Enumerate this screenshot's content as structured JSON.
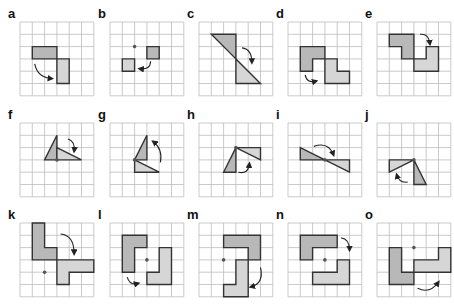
{
  "colors": {
    "grid": "#bdbdbd",
    "original_fill": "#b8b8b8",
    "image_fill": "#d6d6d6",
    "outline": "#333333",
    "arrow": "#222222",
    "center_dot": "#555555"
  },
  "grid": {
    "cols": 6,
    "rows": 6,
    "cell": 12.3
  },
  "panels": [
    {
      "label": "a",
      "x": 20,
      "y": 22,
      "original": [
        [
          1,
          2
        ],
        [
          3,
          2
        ],
        [
          3,
          3
        ],
        [
          1,
          3
        ]
      ],
      "image": [
        [
          3,
          3
        ],
        [
          4,
          3
        ],
        [
          4,
          5
        ],
        [
          3,
          5
        ]
      ],
      "dot": null,
      "arrow": {
        "from": [
          1.2,
          3.4
        ],
        "ctrl": [
          1.4,
          4.5
        ],
        "to": [
          2.6,
          4.6
        ]
      }
    },
    {
      "label": "b",
      "x": 110,
      "y": 22,
      "original": [
        [
          3,
          2
        ],
        [
          4,
          2
        ],
        [
          4,
          3
        ],
        [
          3,
          3
        ]
      ],
      "image": [
        [
          1,
          3
        ],
        [
          2,
          3
        ],
        [
          2,
          4
        ],
        [
          1,
          4
        ]
      ],
      "dot": [
        2,
        2
      ],
      "arrow": {
        "from": [
          3.3,
          3.2
        ],
        "ctrl": [
          3.3,
          3.9
        ],
        "to": [
          2.4,
          3.8
        ]
      }
    },
    {
      "label": "c",
      "x": 199,
      "y": 22,
      "original": [
        [
          1,
          1
        ],
        [
          3,
          1
        ],
        [
          3,
          3
        ]
      ],
      "image": [
        [
          3,
          3
        ],
        [
          3,
          5
        ],
        [
          5,
          5
        ]
      ],
      "dot": null,
      "arrow": {
        "from": [
          3.5,
          2.1
        ],
        "ctrl": [
          4.3,
          2.2
        ],
        "to": [
          4.3,
          3.3
        ]
      }
    },
    {
      "label": "d",
      "x": 288,
      "y": 22,
      "original": [
        [
          1,
          2
        ],
        [
          3,
          2
        ],
        [
          3,
          3
        ],
        [
          2,
          3
        ],
        [
          2,
          4
        ],
        [
          1,
          4
        ]
      ],
      "image": [
        [
          3,
          3
        ],
        [
          4,
          3
        ],
        [
          4,
          4
        ],
        [
          5,
          4
        ],
        [
          5,
          5
        ],
        [
          3,
          5
        ]
      ],
      "dot": null,
      "arrow": {
        "from": [
          1.4,
          4.3
        ],
        "ctrl": [
          1.5,
          5
        ],
        "to": [
          2.3,
          4.8
        ]
      }
    },
    {
      "label": "e",
      "x": 377,
      "y": 22,
      "original": [
        [
          1,
          1
        ],
        [
          3,
          1
        ],
        [
          3,
          3
        ],
        [
          2,
          3
        ],
        [
          2,
          2
        ],
        [
          1,
          2
        ]
      ],
      "image": [
        [
          4,
          2
        ],
        [
          5,
          2
        ],
        [
          5,
          4
        ],
        [
          3,
          4
        ],
        [
          3,
          3
        ],
        [
          4,
          3
        ]
      ],
      "dot": null,
      "arrow": {
        "from": [
          3.5,
          1
        ],
        "ctrl": [
          4.2,
          0.9
        ],
        "to": [
          4.3,
          1.8
        ]
      }
    },
    {
      "label": "f",
      "x": 20,
      "y": 123,
      "original": [
        [
          3,
          1
        ],
        [
          2,
          3
        ],
        [
          3,
          3
        ]
      ],
      "image": [
        [
          3,
          2
        ],
        [
          3,
          3
        ],
        [
          5,
          3
        ]
      ],
      "dot": [
        3,
        3
      ],
      "arrow": {
        "from": [
          3.9,
          1.3
        ],
        "ctrl": [
          4.5,
          1.5
        ],
        "to": [
          4.4,
          2.3
        ]
      }
    },
    {
      "label": "g",
      "x": 110,
      "y": 123,
      "original": [
        [
          3,
          1
        ],
        [
          2,
          3
        ],
        [
          3,
          3
        ]
      ],
      "image": [
        [
          2,
          3
        ],
        [
          2,
          4
        ],
        [
          4,
          4
        ]
      ],
      "dot": [
        2,
        3
      ],
      "arrow": {
        "from": [
          4.1,
          3.2
        ],
        "ctrl": [
          4.3,
          2.1
        ],
        "to": [
          3.5,
          1.5
        ]
      }
    },
    {
      "label": "h",
      "x": 199,
      "y": 123,
      "original": [
        [
          3,
          2
        ],
        [
          2,
          4
        ],
        [
          3,
          4
        ]
      ],
      "image": [
        [
          3,
          2
        ],
        [
          5,
          2
        ],
        [
          5,
          3
        ]
      ],
      "dot": [
        3,
        2
      ],
      "arrow": {
        "from": [
          3.2,
          4
        ],
        "ctrl": [
          4,
          4.2
        ],
        "to": [
          4.1,
          3.3
        ]
      }
    },
    {
      "label": "i",
      "x": 288,
      "y": 123,
      "original": [
        [
          1,
          2
        ],
        [
          3,
          3
        ],
        [
          1,
          3
        ]
      ],
      "image": [
        [
          3,
          3
        ],
        [
          5,
          3
        ],
        [
          5,
          4
        ]
      ],
      "dot": [
        3,
        3
      ],
      "arrow": {
        "from": [
          2.1,
          1.9
        ],
        "ctrl": [
          3.3,
          1.5
        ],
        "to": [
          3.7,
          2.6
        ]
      }
    },
    {
      "label": "j",
      "x": 377,
      "y": 123,
      "original": [
        [
          3,
          3
        ],
        [
          4,
          5
        ],
        [
          3,
          5
        ]
      ],
      "image": [
        [
          1,
          3
        ],
        [
          3,
          3
        ],
        [
          1,
          4
        ]
      ],
      "dot": [
        3,
        3
      ],
      "arrow": {
        "from": [
          2.5,
          4.8
        ],
        "ctrl": [
          1.8,
          4.9
        ],
        "to": [
          1.6,
          4.2
        ]
      }
    },
    {
      "label": "k",
      "x": 20,
      "y": 223,
      "original": [
        [
          1,
          0
        ],
        [
          2,
          0
        ],
        [
          2,
          2
        ],
        [
          3,
          2
        ],
        [
          3,
          3
        ],
        [
          1,
          3
        ]
      ],
      "image": [
        [
          3,
          3
        ],
        [
          6,
          3
        ],
        [
          6,
          4
        ],
        [
          4,
          4
        ],
        [
          4,
          5
        ],
        [
          3,
          5
        ]
      ],
      "dot": [
        2,
        4
      ],
      "arrow": {
        "from": [
          3.3,
          0.9
        ],
        "ctrl": [
          4.4,
          1
        ],
        "to": [
          4.4,
          2.5
        ]
      }
    },
    {
      "label": "l",
      "x": 110,
      "y": 223,
      "original": [
        [
          1,
          1
        ],
        [
          3,
          1
        ],
        [
          3,
          2
        ],
        [
          2,
          2
        ],
        [
          2,
          4
        ],
        [
          1,
          4
        ]
      ],
      "image": [
        [
          4,
          2
        ],
        [
          5,
          2
        ],
        [
          5,
          5
        ],
        [
          3,
          5
        ],
        [
          3,
          4
        ],
        [
          4,
          4
        ]
      ],
      "dot": [
        3,
        3
      ],
      "arrow": {
        "from": [
          1.4,
          4.4
        ],
        "ctrl": [
          1.6,
          5.1
        ],
        "to": [
          2.3,
          4.9
        ]
      }
    },
    {
      "label": "m",
      "x": 199,
      "y": 223,
      "original": [
        [
          2,
          1
        ],
        [
          5,
          1
        ],
        [
          5,
          3
        ],
        [
          4,
          3
        ],
        [
          4,
          2
        ],
        [
          2,
          2
        ]
      ],
      "image": [
        [
          3,
          3
        ],
        [
          4,
          3
        ],
        [
          4,
          6
        ],
        [
          2,
          6
        ],
        [
          2,
          5
        ],
        [
          3,
          5
        ]
      ],
      "dot": [
        2,
        3
      ],
      "arrow": {
        "from": [
          5,
          3.6
        ],
        "ctrl": [
          5.3,
          4.9
        ],
        "to": [
          4.2,
          5.2
        ]
      }
    },
    {
      "label": "n",
      "x": 288,
      "y": 223,
      "original": [
        [
          1,
          1
        ],
        [
          4,
          1
        ],
        [
          4,
          2
        ],
        [
          2,
          2
        ],
        [
          2,
          3
        ],
        [
          1,
          3
        ]
      ],
      "image": [
        [
          4,
          3
        ],
        [
          5,
          3
        ],
        [
          5,
          5
        ],
        [
          2,
          5
        ],
        [
          2,
          4
        ],
        [
          4,
          4
        ]
      ],
      "dot": [
        3,
        3
      ],
      "arrow": {
        "from": [
          4.3,
          1.2
        ],
        "ctrl": [
          5,
          1.3
        ],
        "to": [
          5,
          2.2
        ]
      }
    },
    {
      "label": "o",
      "x": 377,
      "y": 223,
      "original": [
        [
          1,
          2
        ],
        [
          2,
          2
        ],
        [
          2,
          4
        ],
        [
          3,
          4
        ],
        [
          3,
          5
        ],
        [
          1,
          5
        ]
      ],
      "image": [
        [
          5,
          2
        ],
        [
          6,
          2
        ],
        [
          6,
          4
        ],
        [
          3,
          4
        ],
        [
          3,
          3
        ],
        [
          5,
          3
        ]
      ],
      "dot": [
        3,
        2
      ],
      "arrow": {
        "from": [
          3.3,
          5.3
        ],
        "ctrl": [
          4.3,
          5.8
        ],
        "to": [
          5,
          4.8
        ]
      }
    }
  ]
}
